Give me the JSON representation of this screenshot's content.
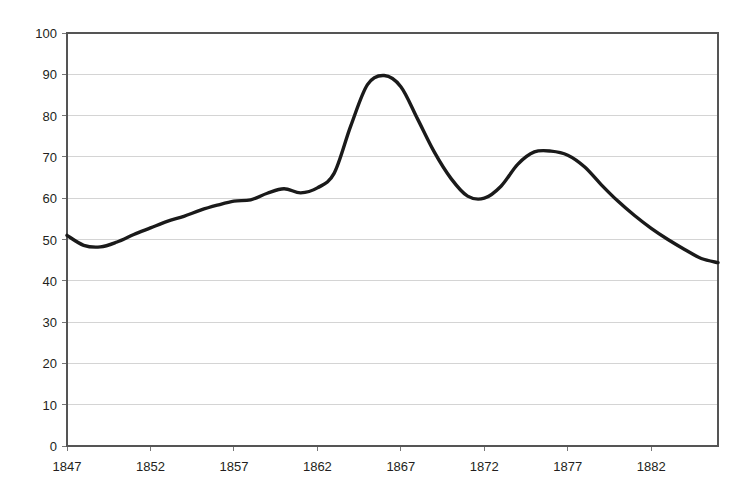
{
  "chart_data": {
    "type": "line",
    "title": "",
    "subtitle": "",
    "xlabel": "",
    "ylabel": "",
    "xlim": [
      1847,
      1886
    ],
    "ylim": [
      0,
      100
    ],
    "grid": true,
    "legend": false,
    "legend_position": "none",
    "line_color": "#1a1a1a",
    "grid_color": "#c9c9c9",
    "axis_color": "#555555",
    "y_ticks": [
      0,
      10,
      20,
      30,
      40,
      50,
      60,
      70,
      80,
      90,
      100
    ],
    "y_tick_labels": [
      "0",
      "10",
      "20",
      "30",
      "40",
      "50",
      "60",
      "70",
      "80",
      "90",
      "100"
    ],
    "x_ticks": [
      1847,
      1852,
      1857,
      1862,
      1867,
      1872,
      1877,
      1882
    ],
    "x_tick_labels": [
      "1847",
      "1852",
      "1857",
      "1862",
      "1867",
      "1872",
      "1877",
      "1882"
    ],
    "x": [
      1847,
      1848,
      1849,
      1850,
      1851,
      1852,
      1853,
      1854,
      1855,
      1856,
      1857,
      1858,
      1859,
      1860,
      1861,
      1862,
      1863,
      1864,
      1865,
      1866,
      1867,
      1868,
      1869,
      1870,
      1871,
      1872,
      1873,
      1874,
      1875,
      1876,
      1877,
      1878,
      1879,
      1880,
      1881,
      1882,
      1883,
      1884,
      1885,
      1886
    ],
    "values": [
      51.0,
      48.6,
      48.2,
      49.4,
      51.2,
      52.8,
      54.4,
      55.6,
      57.1,
      58.3,
      59.3,
      59.6,
      61.2,
      62.3,
      61.3,
      62.5,
      66.0,
      77.5,
      87.5,
      89.7,
      87.0,
      79.2,
      71.2,
      64.8,
      60.5,
      60.0,
      62.9,
      68.2,
      71.2,
      71.4,
      70.4,
      67.6,
      63.3,
      59.3,
      55.8,
      52.7,
      50.0,
      47.6,
      45.4,
      44.4
    ],
    "series_name": "value",
    "annotations": []
  }
}
